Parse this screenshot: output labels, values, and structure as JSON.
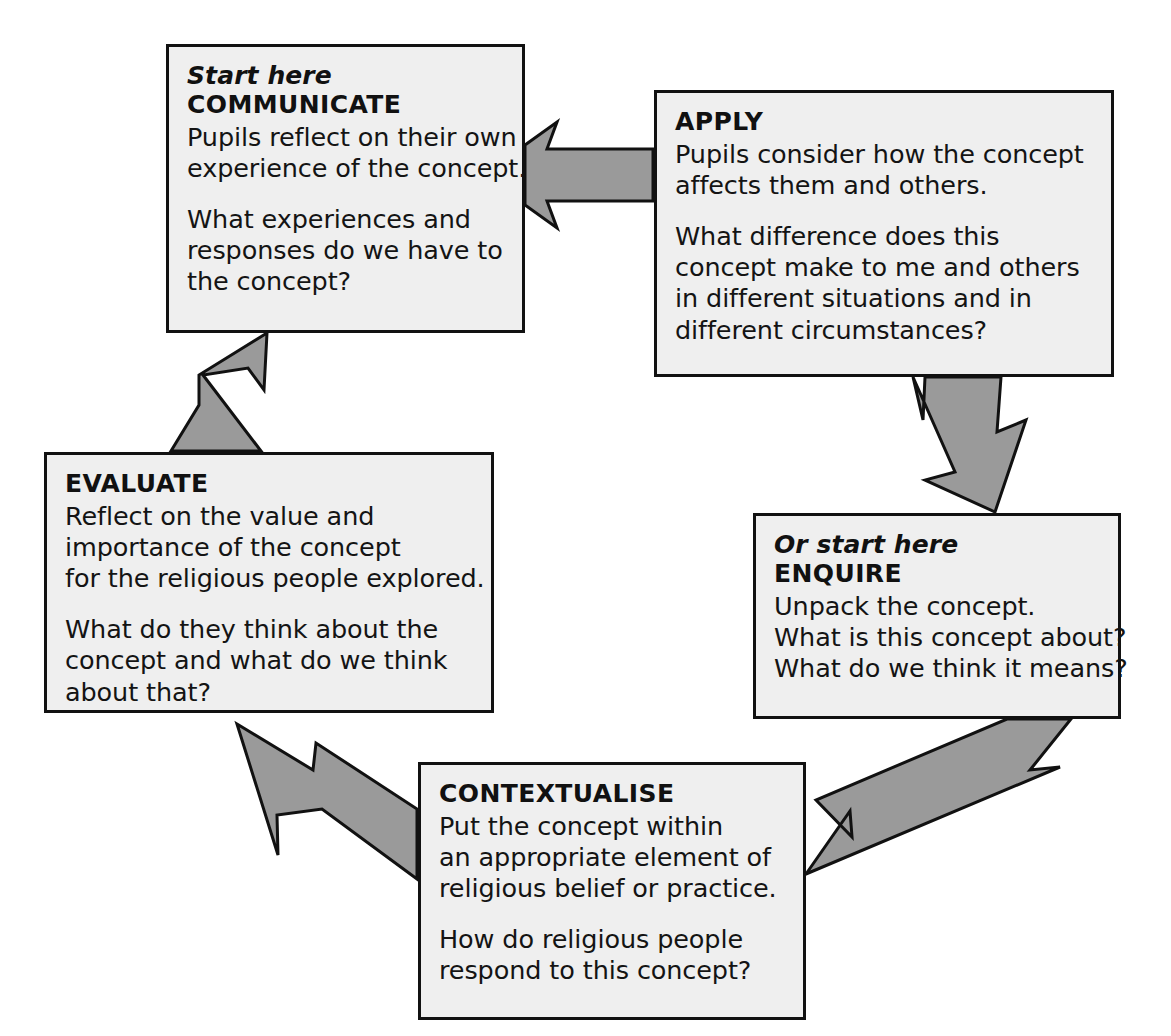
{
  "diagram": {
    "background_color": "#ffffff",
    "box_fill_color": "#efefef",
    "box_border_color": "#111111",
    "arrow_fill_color": "#9a9a9a",
    "arrow_outline_color": "#111111"
  },
  "nodes": [
    {
      "id": "communicate",
      "eyebrow": "Start here",
      "title": "COMMUNICATE",
      "paragraphs": [
        [
          "Pupils reflect on their own",
          "experience of the concept."
        ],
        [
          "What experiences and",
          "responses do we have to",
          "the concept?"
        ]
      ]
    },
    {
      "id": "apply",
      "eyebrow": "",
      "title": "APPLY",
      "paragraphs": [
        [
          "Pupils consider how the concept",
          "affects them and others."
        ],
        [
          "What difference does this",
          "concept make to me and others",
          "in different situations and in",
          "different circumstances?"
        ]
      ]
    },
    {
      "id": "enquire",
      "eyebrow": "Or start here",
      "title": "ENQUIRE",
      "paragraphs": [
        [
          "Unpack the concept.",
          "What is this concept about?",
          "What do we think it means?"
        ]
      ]
    },
    {
      "id": "contextualise",
      "eyebrow": "",
      "title": "CONTEXTUALISE",
      "paragraphs": [
        [
          "Put the concept within",
          "an appropriate element of",
          "religious belief or practice."
        ],
        [
          "How do religious people",
          "respond to this concept?"
        ]
      ]
    },
    {
      "id": "evaluate",
      "eyebrow": "",
      "title": "EVALUATE",
      "paragraphs": [
        [
          "Reflect on the value and",
          "importance of the concept",
          "for the religious people explored."
        ],
        [
          "What do they think about the",
          "concept and what do we think",
          "about that?"
        ]
      ]
    }
  ],
  "arrows": [
    {
      "id": "communicate-to-apply",
      "from": "COMMUNICATE",
      "to": "APPLY",
      "direction": "right"
    },
    {
      "id": "apply-to-enquire",
      "from": "APPLY",
      "to": "ENQUIRE",
      "direction": "down-right"
    },
    {
      "id": "enquire-to-contextualise",
      "from": "ENQUIRE",
      "to": "CONTEXTUALISE",
      "direction": "down-left"
    },
    {
      "id": "contextualise-to-evaluate",
      "from": "CONTEXTUALISE",
      "to": "EVALUATE",
      "direction": "up-left"
    },
    {
      "id": "evaluate-to-communicate",
      "from": "EVALUATE",
      "to": "COMMUNICATE",
      "direction": "up-right"
    }
  ]
}
